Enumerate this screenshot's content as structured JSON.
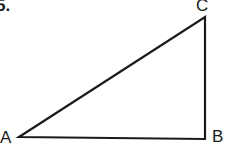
{
  "problem_number": "5.",
  "diagram": {
    "type": "right-triangle",
    "vertices": [
      {
        "label": "A",
        "x": 19,
        "y": 137
      },
      {
        "label": "B",
        "x": 205,
        "y": 139
      },
      {
        "label": "C",
        "x": 205,
        "y": 17
      }
    ],
    "stroke_color": "#1a1a1a"
  }
}
